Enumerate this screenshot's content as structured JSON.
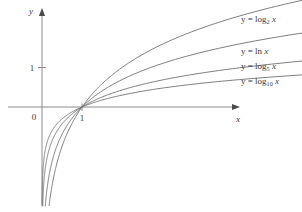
{
  "chart_data": {
    "type": "line",
    "title": "",
    "xlabel": "x",
    "ylabel": "y",
    "xlim": [
      -0.18,
      7.6
    ],
    "ylim": [
      -2.6,
      2.5
    ],
    "grid": false,
    "legend_position": "right-of-curve-ends",
    "axis_tick_labels": {
      "origin": "0",
      "x_ticks": [
        "1"
      ],
      "y_ticks": [
        "1"
      ]
    },
    "annotations": [
      "y = log_2 x",
      "y = ln x",
      "y = log_5 x",
      "y = log_10 x"
    ],
    "series": [
      {
        "name": "y = log_2 x",
        "base": "2",
        "label_prefix": "y = log",
        "label_sub": "2",
        "label_suffix": "x",
        "color": "#6e6e6e",
        "x": [
          0.06,
          0.1,
          0.15,
          0.22,
          0.3,
          0.4,
          0.55,
          0.7,
          1.0,
          1.4,
          1.9,
          2.5,
          3.2,
          4.0,
          5.0,
          6.0,
          7.0,
          7.45
        ],
        "y": [
          -4.06,
          -3.32,
          -2.74,
          -2.18,
          -1.74,
          -1.32,
          -0.86,
          -0.51,
          0.0,
          0.49,
          0.93,
          1.32,
          1.68,
          2.0,
          2.32,
          2.58,
          2.81,
          2.9
        ]
      },
      {
        "name": "y = ln x",
        "base": "e",
        "label_prefix": "y = ln",
        "label_sub": "",
        "label_suffix": "x",
        "color": "#6e6e6e",
        "x": [
          0.06,
          0.1,
          0.15,
          0.22,
          0.3,
          0.4,
          0.55,
          0.7,
          1.0,
          1.4,
          1.9,
          2.5,
          3.2,
          4.0,
          5.0,
          6.0,
          7.0,
          7.45
        ],
        "y": [
          -2.81,
          -2.3,
          -1.9,
          -1.51,
          -1.2,
          -0.92,
          -0.6,
          -0.36,
          0.0,
          0.34,
          0.64,
          0.92,
          1.16,
          1.39,
          1.61,
          1.79,
          1.95,
          2.01
        ]
      },
      {
        "name": "y = log_5 x",
        "base": "5",
        "label_prefix": "y = log",
        "label_sub": "5",
        "label_suffix": "x",
        "color": "#6e6e6e",
        "x": [
          0.06,
          0.1,
          0.15,
          0.22,
          0.3,
          0.4,
          0.55,
          0.7,
          1.0,
          1.4,
          1.9,
          2.5,
          3.2,
          4.0,
          5.0,
          6.0,
          7.0,
          7.45
        ],
        "y": [
          -1.75,
          -1.43,
          -1.18,
          -0.94,
          -0.75,
          -0.57,
          -0.37,
          -0.22,
          0.0,
          0.21,
          0.4,
          0.57,
          0.72,
          0.86,
          1.0,
          1.11,
          1.21,
          1.25
        ]
      },
      {
        "name": "y = log_10 x",
        "base": "10",
        "label_prefix": "y = log",
        "label_sub": "10",
        "label_suffix": "x",
        "color": "#6e6e6e",
        "x": [
          0.06,
          0.1,
          0.15,
          0.22,
          0.3,
          0.4,
          0.55,
          0.7,
          1.0,
          1.4,
          1.9,
          2.5,
          3.2,
          4.0,
          5.0,
          6.0,
          7.0,
          7.45
        ],
        "y": [
          -1.22,
          -1.0,
          -0.82,
          -0.66,
          -0.52,
          -0.4,
          -0.26,
          -0.15,
          0.0,
          0.15,
          0.28,
          0.4,
          0.51,
          0.6,
          0.7,
          0.78,
          0.85,
          0.87
        ]
      }
    ]
  },
  "labels": {
    "y_axis": "y",
    "x_axis": "x",
    "origin": "0",
    "y_one": "1",
    "x_one": "1",
    "eq_prefix": "y = log",
    "ln_label": "y = ln",
    "var_x": "x",
    "sub_2": "2",
    "sub_5": "5",
    "sub_10": "10"
  },
  "style": {
    "curve_color": "#6e6e6e",
    "axis_color": "#8c8c8c",
    "text_color": "#3a3a3a",
    "background": "#ffffff"
  }
}
